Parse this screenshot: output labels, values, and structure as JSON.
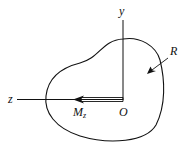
{
  "figure": {
    "type": "cross-section diagram",
    "labels": {
      "y_axis": "y",
      "z_axis": "z",
      "origin": "O",
      "moment": "M",
      "moment_subscript": "z",
      "resultant": "R"
    },
    "colors": {
      "stroke": "#111111",
      "background": "#ffffff"
    }
  }
}
